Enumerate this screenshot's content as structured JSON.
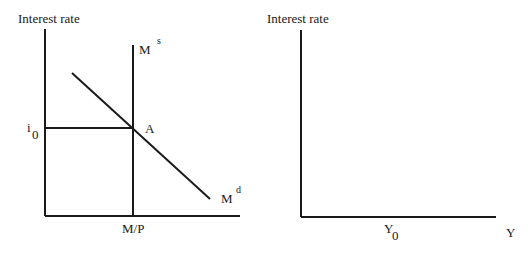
{
  "left_panel": {
    "y_axis_label": "Interest rate",
    "x_axis_label": "M/P",
    "supply_curve": {
      "label": "M",
      "superscript": "s"
    },
    "demand_curve": {
      "label": "M",
      "superscript": "d"
    },
    "equilibrium_point": "A",
    "rate_label": {
      "label": "i",
      "subscript": "0"
    }
  },
  "right_panel": {
    "y_axis_label": "Interest rate",
    "x_axis_label": "Y",
    "output_label": {
      "label": "Y",
      "subscript": "0"
    }
  }
}
